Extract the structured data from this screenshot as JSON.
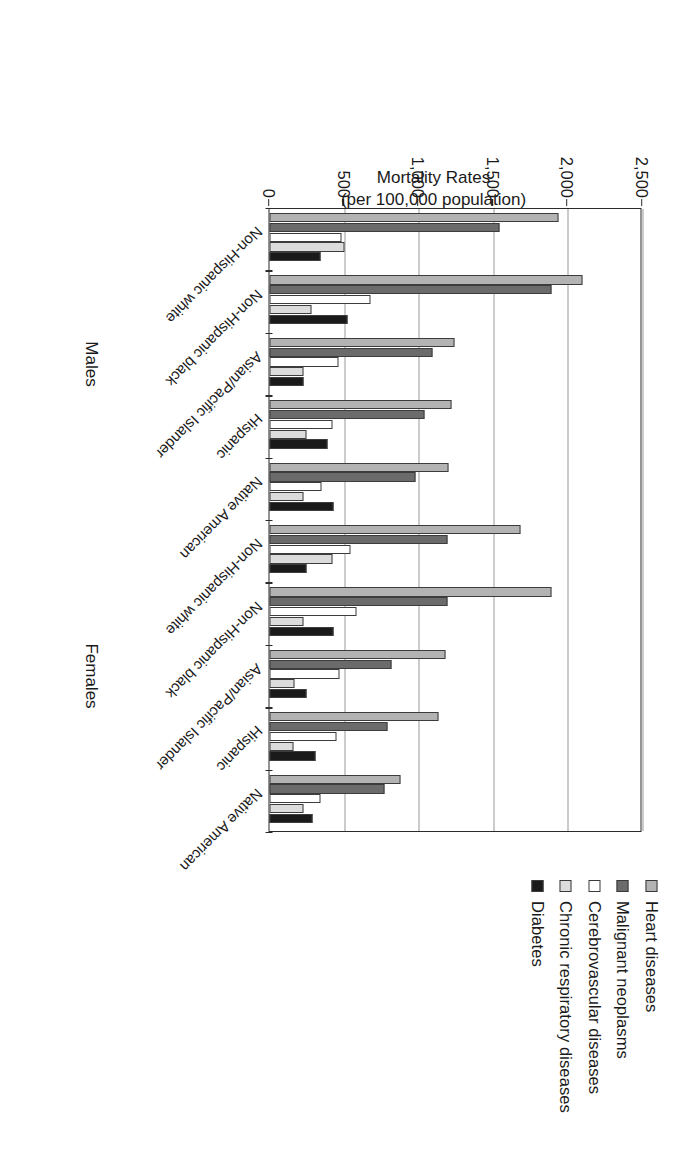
{
  "chart_data": {
    "type": "bar",
    "title": "",
    "xlabel": "",
    "ylabel": "Mortality Rates (per 100,000 population)",
    "ylabel_line1": "Mortality Rates",
    "ylabel_line2": "(per 100,000 population)",
    "ylim": [
      0,
      2500
    ],
    "yticks": [
      0,
      500,
      1000,
      1500,
      2000,
      2500
    ],
    "ytick_labels": [
      "0",
      "500",
      "1,000",
      "1,500",
      "2,000",
      "2,500"
    ],
    "grid": true,
    "legend_position": "right",
    "groups": [
      "Males",
      "Females"
    ],
    "categories": [
      "Non-Hispanic white",
      "Non-Hispanic black",
      "Asian/Pacific Islander",
      "Hispanic",
      "Native American",
      "Non-Hispanic white",
      "Non-Hispanic black",
      "Asian/Pacific Islander",
      "Hispanic",
      "Native American"
    ],
    "series": [
      {
        "name": "Heart diseases",
        "color": "#b3b3b3",
        "values": [
          1940,
          2100,
          1240,
          1220,
          1200,
          1680,
          1890,
          1180,
          1130,
          880
        ]
      },
      {
        "name": "Malignant neoplasms",
        "color": "#6b6b6b",
        "values": [
          1540,
          1890,
          1090,
          1040,
          980,
          1190,
          1190,
          820,
          790,
          770
        ]
      },
      {
        "name": "Cerebrovascular diseases",
        "color": "#ffffff",
        "values": [
          480,
          680,
          460,
          420,
          350,
          540,
          580,
          470,
          450,
          340
        ]
      },
      {
        "name": "Chronic respiratory diseases",
        "color": "#dcdcdc",
        "values": [
          500,
          280,
          230,
          250,
          230,
          420,
          230,
          170,
          160,
          230
        ]
      },
      {
        "name": "Diabetes",
        "color": "#1a1a1a",
        "values": [
          340,
          520,
          230,
          390,
          430,
          250,
          430,
          250,
          310,
          290
        ]
      }
    ]
  },
  "legend": {
    "items": [
      {
        "label": "Heart diseases",
        "color": "#b3b3b3"
      },
      {
        "label": "Malignant neoplasms",
        "color": "#6b6b6b"
      },
      {
        "label": "Cerebrovascular diseases",
        "color": "#ffffff"
      },
      {
        "label": "Chronic respiratory diseases",
        "color": "#dcdcdc"
      },
      {
        "label": "Diabetes",
        "color": "#1a1a1a"
      }
    ]
  },
  "axis": {
    "value_axis_title_line1": "Mortality Rates",
    "value_axis_title_line2": "(per 100,000 population)"
  }
}
